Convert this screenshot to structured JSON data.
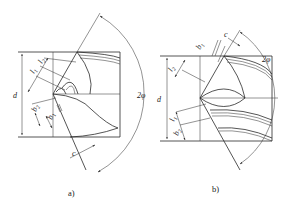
{
  "figure": {
    "panels": [
      {
        "id": "a",
        "caption": "a)",
        "labels": {
          "diameter": "d",
          "l1": "l",
          "l1_sub": "1",
          "l2": "l",
          "l2_sub": "2",
          "b1": "b",
          "b1_sub": "1",
          "b2": "b",
          "b2_sub": "2",
          "c": "c",
          "angle": "2φ"
        }
      },
      {
        "id": "b",
        "caption": "b)",
        "labels": {
          "diameter": "d",
          "l1": "l",
          "l1_sub": "1",
          "l2": "l",
          "l2_sub": "2",
          "b1": "b",
          "b1_sub": "1",
          "b2": "b",
          "b2_sub": "2",
          "c": "c",
          "angle": "2φ"
        }
      }
    ],
    "colors": {
      "line": "#2a2a2a",
      "background": "#ffffff"
    }
  }
}
